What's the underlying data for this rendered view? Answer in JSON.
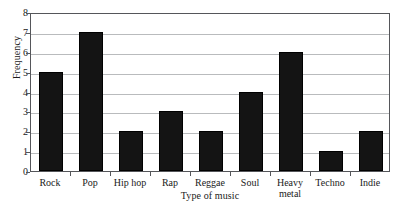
{
  "chart_data": {
    "type": "bar",
    "title": "",
    "xlabel": "Type of music",
    "ylabel": "Frequency",
    "categories": [
      "Rock",
      "Pop",
      "Hip hop",
      "Rap",
      "Reggae",
      "Soul",
      "Heavy metal",
      "Techno",
      "Indie"
    ],
    "values": [
      5,
      7,
      2,
      3,
      2,
      4,
      6,
      1,
      2
    ],
    "ylim": [
      0,
      8
    ],
    "yticks": [
      0,
      1,
      2,
      3,
      4,
      5,
      6,
      7,
      8
    ],
    "ytick_labels": [
      "0",
      "1",
      "2",
      "3",
      "4",
      "5",
      "6",
      "7",
      "8"
    ],
    "grid": true,
    "legend": "none",
    "bar_color": "#141414",
    "grid_color": "#b9bbbd",
    "axis_color": "#55565a",
    "background_color": "#ffffff"
  }
}
